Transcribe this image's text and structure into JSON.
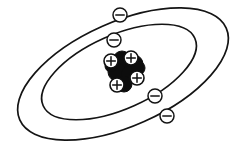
{
  "figure": {
    "background_color": "#ffffff",
    "stroke_color": "#141414",
    "width": 246,
    "height": 149
  },
  "orbits": [
    {
      "name": "outer-orbit",
      "label": "outer electron shell",
      "center_x": 123,
      "center_y": 74,
      "radius_x": 113,
      "radius_y": 52,
      "rotation_deg": -24,
      "stroke_width": 1.7
    },
    {
      "name": "inner-orbit",
      "label": "inner electron shell",
      "center_x": 119,
      "center_y": 72,
      "radius_x": 83,
      "radius_y": 37,
      "rotation_deg": -24,
      "stroke_width": 1.7
    }
  ],
  "electrons": [
    {
      "name": "electron-outer-top",
      "shell": "outer",
      "charge": "-",
      "x": 120,
      "y": 15,
      "r": 7
    },
    {
      "name": "electron-inner-top",
      "shell": "inner",
      "charge": "-",
      "x": 114,
      "y": 40,
      "r": 7
    },
    {
      "name": "electron-inner-bottom",
      "shell": "inner",
      "charge": "-",
      "x": 155,
      "y": 96,
      "r": 7
    },
    {
      "name": "electron-outer-bottom",
      "shell": "outer",
      "charge": "-",
      "x": 167,
      "y": 116,
      "r": 7
    }
  ],
  "nucleus": {
    "name": "nucleus",
    "label": "atomic nucleus",
    "neutron_color": "#0d0d0d",
    "proton_color": "#ffffff",
    "neutrons": [
      {
        "name": "neutron",
        "x": 122,
        "y": 60,
        "r": 9
      },
      {
        "name": "neutron",
        "x": 134,
        "y": 64,
        "r": 9
      },
      {
        "name": "neutron",
        "x": 117,
        "y": 72,
        "r": 9
      },
      {
        "name": "neutron",
        "x": 130,
        "y": 75,
        "r": 9
      },
      {
        "name": "neutron",
        "x": 124,
        "y": 84,
        "r": 8
      },
      {
        "name": "neutron",
        "x": 138,
        "y": 68,
        "r": 7
      },
      {
        "name": "neutron",
        "x": 111,
        "y": 66,
        "r": 6
      }
    ],
    "protons": [
      {
        "name": "proton",
        "charge": "+",
        "x": 111,
        "y": 61,
        "r": 7
      },
      {
        "name": "proton",
        "charge": "+",
        "x": 131,
        "y": 58,
        "r": 7
      },
      {
        "name": "proton",
        "charge": "+",
        "x": 137,
        "y": 78,
        "r": 7
      },
      {
        "name": "proton",
        "charge": "+",
        "x": 117,
        "y": 85,
        "r": 7
      }
    ]
  },
  "counts": {
    "electrons": 4,
    "protons": 4,
    "neutrons": 7,
    "shells": 2
  }
}
